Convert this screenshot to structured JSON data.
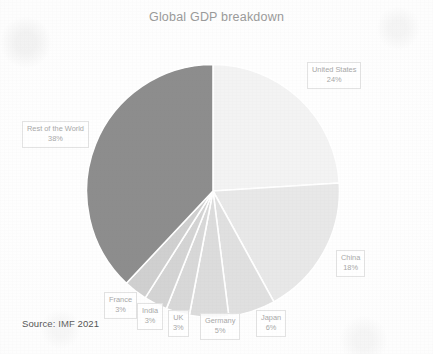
{
  "chart_data": {
    "type": "pie",
    "title": "Global GDP breakdown",
    "categories": [
      "United States",
      "China",
      "Japan",
      "Germany",
      "UK",
      "India",
      "France",
      "Rest of the World"
    ],
    "values": [
      24,
      18,
      6,
      5,
      3,
      3,
      3,
      38
    ],
    "unit": "%",
    "start_angle_deg": 0,
    "direction": "clockwise",
    "legend": "none",
    "labels_position": "outside-callout-boxes",
    "slice_colors": [
      "#f3f3f3",
      "#e8e8e8",
      "#e0e0e0",
      "#dcdcdc",
      "#d8d8d8",
      "#d4d4d4",
      "#d0d0d0",
      "#8d8d8d"
    ],
    "slices": [
      {
        "label": "United States",
        "value": 24,
        "display": "24%",
        "color": "#f3f3f3"
      },
      {
        "label": "China",
        "value": 18,
        "display": "18%",
        "color": "#e8e8e8"
      },
      {
        "label": "Japan",
        "value": 6,
        "display": "6%",
        "color": "#e0e0e0"
      },
      {
        "label": "Germany",
        "value": 5,
        "display": "5%",
        "color": "#dcdcdc"
      },
      {
        "label": "UK",
        "value": 3,
        "display": "3%",
        "color": "#d8d8d8"
      },
      {
        "label": "India",
        "value": 3,
        "display": "3%",
        "color": "#d4d4d4"
      },
      {
        "label": "France",
        "value": 3,
        "display": "3%",
        "color": "#d0d0d0"
      },
      {
        "label": "Rest of the World",
        "value": 38,
        "display": "38%",
        "color": "#8d8d8d"
      }
    ],
    "annotations": [
      "Source: IMF 2021"
    ]
  },
  "title": "Global GDP breakdown",
  "callouts": {
    "united_states": {
      "label": "United States",
      "pct": "24%"
    },
    "china": {
      "label": "China",
      "pct": "18%"
    },
    "rest_of_world": {
      "label": "Rest of the World",
      "pct": "38%"
    },
    "japan": {
      "label": "Japan",
      "pct": "6%"
    },
    "germany": {
      "label": "Germany",
      "pct": "5%"
    },
    "uk": {
      "label": "UK",
      "pct": "3%"
    },
    "india": {
      "label": "India",
      "pct": "3%"
    },
    "france": {
      "label": "France",
      "pct": "3%"
    }
  },
  "source_note": "Source: IMF 2021",
  "colors": {
    "title_text": "#9a9a9a",
    "callout_text": "#a8a8a8",
    "callout_border": "#e3e3e3",
    "source_text": "#555555",
    "slice_divider": "#ffffff",
    "page_background": "#fdfdfd"
  }
}
